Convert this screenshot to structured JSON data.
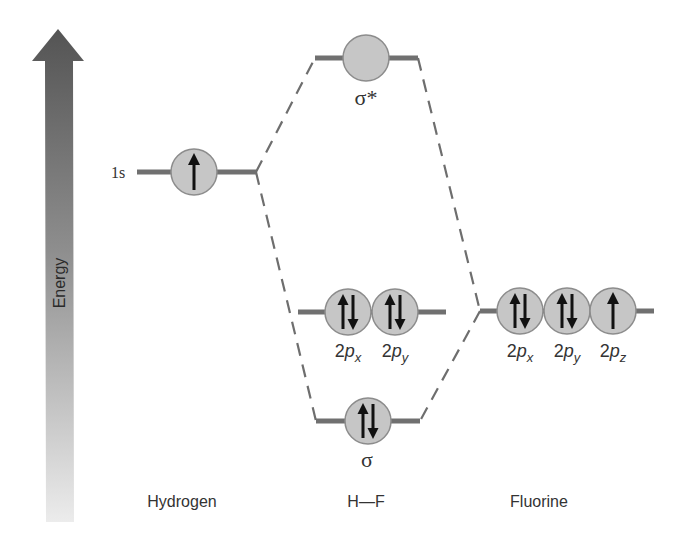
{
  "diagram": {
    "type": "molecular-orbital-energy-diagram",
    "axis": {
      "label": "Energy",
      "direction": "up"
    },
    "columns": {
      "left": "Hydrogen",
      "center": "H—F",
      "right": "Fluorine"
    },
    "hydrogen": {
      "orbital_label": "1s",
      "orbitals": [
        {
          "name": "1s",
          "electrons": 1
        }
      ]
    },
    "molecule": {
      "sigma_star": {
        "label": "σ*",
        "electrons": 0
      },
      "nonbonding": [
        {
          "label_base": "2p",
          "subscript": "x",
          "electrons": 2
        },
        {
          "label_base": "2p",
          "subscript": "y",
          "electrons": 2
        }
      ],
      "sigma": {
        "label": "σ",
        "electrons": 2
      }
    },
    "fluorine": {
      "orbitals": [
        {
          "label_base": "2p",
          "subscript": "x",
          "electrons": 2
        },
        {
          "label_base": "2p",
          "subscript": "y",
          "electrons": 2
        },
        {
          "label_base": "2p",
          "subscript": "z",
          "electrons": 1
        }
      ]
    },
    "colors": {
      "arrow_top": "#555555",
      "arrow_bottom": "#e6e6e6",
      "orbital_fill": "#c6c6c6",
      "level_line": "#707070"
    }
  }
}
